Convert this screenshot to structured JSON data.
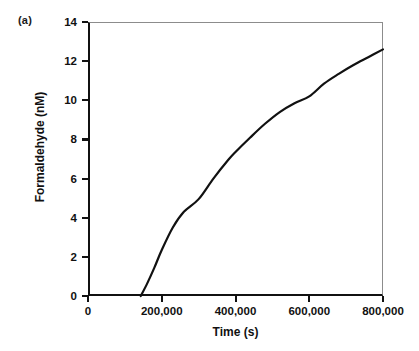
{
  "panel": {
    "label": "(a)"
  },
  "chart_data": {
    "type": "line",
    "title": "",
    "subtitle": "",
    "xlabel": "Time (s)",
    "ylabel": "Formaldehyde (nM)",
    "xlim": [
      0,
      800000
    ],
    "ylim": [
      0,
      14
    ],
    "xticks": [
      0,
      200000,
      400000,
      600000,
      800000
    ],
    "xticklabels": [
      "0",
      "200,000",
      "400,000",
      "600,000",
      "800,000"
    ],
    "yticks": [
      0,
      2,
      4,
      6,
      8,
      10,
      12,
      14
    ],
    "yticklabels": [
      "0",
      "2",
      "4",
      "6",
      "8",
      "10",
      "12",
      "14"
    ],
    "grid": false,
    "legend": null,
    "annotations": [
      "(a)"
    ],
    "series": [
      {
        "name": "Formaldehyde",
        "color": "#111111",
        "linewidth": 2.2,
        "x": [
          143000,
          160000,
          180000,
          200000,
          230000,
          260000,
          300000,
          340000,
          380000,
          400000,
          440000,
          480000,
          520000,
          560000,
          600000,
          640000,
          680000,
          720000,
          760000,
          800000
        ],
        "y": [
          0.0,
          0.62,
          1.45,
          2.35,
          3.5,
          4.3,
          4.95,
          6.0,
          6.95,
          7.36,
          8.1,
          8.8,
          9.4,
          9.85,
          10.2,
          10.85,
          11.35,
          11.8,
          12.2,
          12.6
        ]
      }
    ]
  }
}
